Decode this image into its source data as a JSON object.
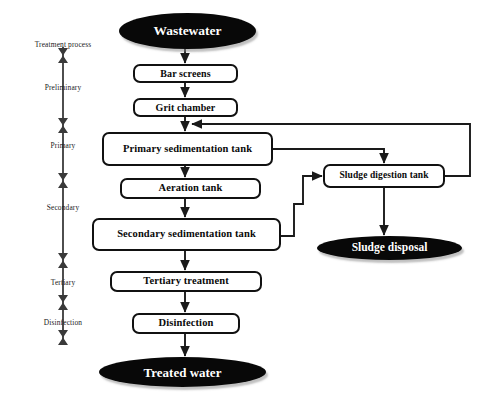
{
  "diagram": {
    "colors": {
      "terminator_fill": "#080808",
      "terminator_text": "#ffffff",
      "box_fill": "#ffffff",
      "box_stroke": "#111111",
      "connector": "#1a1a1a",
      "axis": "#3a3a3a",
      "background": "#ffffff"
    },
    "legend_axis": {
      "heading": "Treatment process",
      "stages": [
        {
          "label": "Preliminary"
        },
        {
          "label": "Primary"
        },
        {
          "label": "Secondary"
        },
        {
          "label": "Tertiary"
        },
        {
          "label": "Disinfection"
        }
      ]
    },
    "nodes": {
      "wastewater": {
        "label": "Wastewater",
        "shape": "ellipse"
      },
      "bar_screens": {
        "label": "Bar screens",
        "shape": "box"
      },
      "grit_chamber": {
        "label": "Grit chamber",
        "shape": "box"
      },
      "primary_sedimentation_tank": {
        "label": "Primary sedimentation tank",
        "shape": "box"
      },
      "aeration_tank": {
        "label": "Aeration tank",
        "shape": "box"
      },
      "secondary_sedimentation_tank": {
        "label": "Secondary sedimentation tank",
        "shape": "box"
      },
      "tertiary_treatment": {
        "label": "Tertiary treatment",
        "shape": "box"
      },
      "disinfection": {
        "label": "Disinfection",
        "shape": "box"
      },
      "treated_water": {
        "label": "Treated water",
        "shape": "ellipse"
      },
      "sludge_digestion_tank": {
        "label": "Sludge digestion tank",
        "shape": "box"
      },
      "sludge_disposal": {
        "label": "Sludge disposal",
        "shape": "ellipse"
      }
    },
    "edges": [
      {
        "from": "wastewater",
        "to": "bar_screens"
      },
      {
        "from": "bar_screens",
        "to": "grit_chamber"
      },
      {
        "from": "grit_chamber",
        "to": "primary_sedimentation_tank"
      },
      {
        "from": "primary_sedimentation_tank",
        "to": "aeration_tank"
      },
      {
        "from": "aeration_tank",
        "to": "secondary_sedimentation_tank"
      },
      {
        "from": "secondary_sedimentation_tank",
        "to": "tertiary_treatment"
      },
      {
        "from": "tertiary_treatment",
        "to": "disinfection"
      },
      {
        "from": "disinfection",
        "to": "treated_water"
      },
      {
        "from": "primary_sedimentation_tank",
        "to": "sludge_digestion_tank"
      },
      {
        "from": "secondary_sedimentation_tank",
        "to": "sludge_digestion_tank"
      },
      {
        "from": "sludge_digestion_tank",
        "to": "sludge_disposal"
      },
      {
        "from": "sludge_digestion_tank",
        "to": "primary_sedimentation_tank"
      }
    ]
  }
}
